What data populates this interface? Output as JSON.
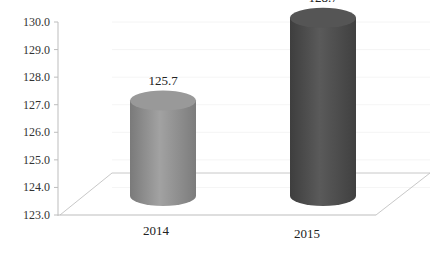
{
  "chart_data": {
    "type": "bar",
    "style": "3d-cylinder",
    "title": "",
    "xlabel": "",
    "ylabel": "",
    "categories": [
      "2014",
      "2015"
    ],
    "values": [
      125.7,
      128.7
    ],
    "data_labels": [
      "125.7",
      "128.7"
    ],
    "bar_colors": [
      "#8c8c8c",
      "#4d4d4d"
    ],
    "ylim": [
      123.0,
      130.0
    ],
    "yticks": [
      "123.0",
      "124.0",
      "125.0",
      "126.0",
      "127.0",
      "128.0",
      "129.0",
      "130.0"
    ],
    "grid": true,
    "legend": "none"
  }
}
